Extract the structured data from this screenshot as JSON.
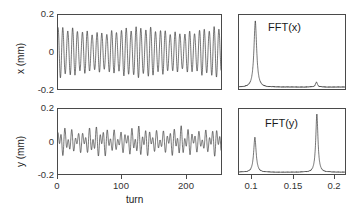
{
  "figure": {
    "caption_context": "Turn-by-turn betatron oscillation and FFT spectra",
    "background": "#ffffff",
    "trace_color": "#1a1a1a",
    "axis_color": "#4a4a4a"
  },
  "panels": {
    "x_turn": {
      "name": "x-vs-turn",
      "ylabel": "x (mm)",
      "xlabel": "turn",
      "yticks": [
        "0.2",
        "0",
        "-0.2"
      ],
      "ytick_values": [
        0.2,
        0,
        -0.2
      ],
      "xticks": [
        "0",
        "100",
        "200"
      ],
      "xtick_values": [
        0,
        100,
        200
      ],
      "xlim": [
        0,
        256
      ],
      "ylim": [
        -0.2,
        0.2
      ]
    },
    "y_turn": {
      "name": "y-vs-turn",
      "ylabel": "y (mm)",
      "xlabel": "turn",
      "yticks": [
        "0.2",
        "0",
        "-0.2"
      ],
      "ytick_values": [
        0.2,
        0,
        -0.2
      ],
      "xticks": [
        "0",
        "100",
        "200"
      ],
      "xtick_values": [
        0,
        100,
        200
      ],
      "xlim": [
        0,
        256
      ],
      "ylim": [
        -0.2,
        0.2
      ]
    },
    "fft_x": {
      "name": "fft-x",
      "label": "FFT(x)",
      "xticks": [],
      "xlim": [
        0.085,
        0.215
      ],
      "ylim": [
        0,
        1
      ]
    },
    "fft_y": {
      "name": "fft-y",
      "label": "FFT(y)",
      "xticks": [
        "0.1",
        "0.15",
        "0.2"
      ],
      "xtick_values": [
        0.1,
        0.15,
        0.2
      ],
      "xlim": [
        0.085,
        0.215
      ],
      "ylim": [
        0,
        1
      ]
    }
  },
  "chart_data": [
    {
      "type": "line",
      "name": "x-vs-turn",
      "title": "",
      "xlabel": "turn",
      "ylabel": "x (mm)",
      "xlim": [
        0,
        256
      ],
      "ylim": [
        -0.2,
        0.2
      ],
      "xticks": [
        0,
        100,
        200
      ],
      "yticks": [
        -0.2,
        0,
        0.2
      ],
      "grid": false,
      "legend": "none",
      "signal_model": {
        "description": "Coherent betatron oscillation, dominant tune 0.1305 with weak secondary tune 0.18 and slow decoherence envelope",
        "components": [
          {
            "tune": 0.1305,
            "amplitude": 0.128,
            "phase": 1.6
          },
          {
            "tune": 0.18,
            "amplitude": 0.012,
            "phase": 0.4
          }
        ],
        "envelope": {
          "type": "beat",
          "modulation_depth": 0.22,
          "beat_period_turns": 128
        },
        "n_turns": 256
      }
    },
    {
      "type": "line",
      "name": "y-vs-turn",
      "title": "",
      "xlabel": "turn",
      "ylabel": "y (mm)",
      "xlim": [
        0,
        256
      ],
      "ylim": [
        -0.2,
        0.2
      ],
      "xticks": [
        0,
        100,
        200
      ],
      "yticks": [
        -0.2,
        0,
        0.2
      ],
      "grid": false,
      "legend": "none",
      "signal_model": {
        "description": "Two-frequency beating oscillation; coupled motion with components at tunes 0.105 and 0.18",
        "components": [
          {
            "tune": 0.1045,
            "amplitude": 0.042,
            "phase": 0.2
          },
          {
            "tune": 0.1805,
            "amplitude": 0.055,
            "phase": 2.1
          }
        ],
        "envelope": {
          "type": "beat",
          "modulation_depth": 0.3,
          "beat_period_turns": 64
        },
        "n_turns": 256
      }
    },
    {
      "type": "line",
      "name": "fft-x",
      "title": "FFT(x)",
      "xlabel": "",
      "ylabel": "",
      "xlim": [
        0.085,
        0.215
      ],
      "ylim": [
        0,
        1
      ],
      "xticks": [],
      "grid": false,
      "legend": "none",
      "peaks": [
        {
          "frequency": 0.105,
          "amplitude": 1.0,
          "width": 0.0022
        },
        {
          "frequency": 0.18,
          "amplitude": 0.075,
          "width": 0.0016
        }
      ],
      "noise_floor": 0.012
    },
    {
      "type": "line",
      "name": "fft-y",
      "title": "FFT(y)",
      "xlabel": "",
      "ylabel": "",
      "xlim": [
        0.085,
        0.215
      ],
      "ylim": [
        0,
        1
      ],
      "xticks": [
        0.1,
        0.15,
        0.2
      ],
      "grid": false,
      "legend": "none",
      "peaks": [
        {
          "frequency": 0.1045,
          "amplitude": 0.6,
          "width": 0.002
        },
        {
          "frequency": 0.1805,
          "amplitude": 1.0,
          "width": 0.0018
        }
      ],
      "noise_floor": 0.012
    }
  ]
}
